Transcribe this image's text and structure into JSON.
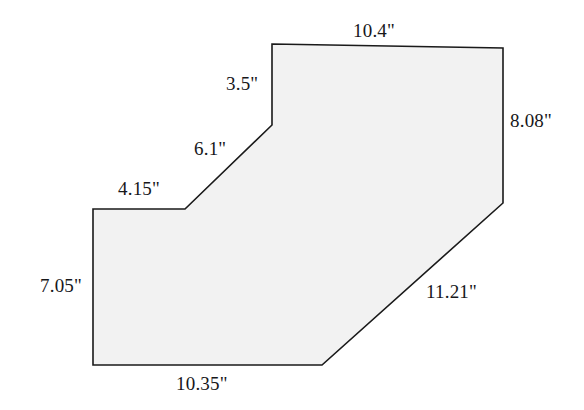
{
  "figure": {
    "kind": "dimensioned-polygon-diagram",
    "units": "inches",
    "fill_color": "#f2f2f2",
    "stroke_color": "#1a1a1a",
    "background_color": "#ffffff",
    "stroke_width": 1.6,
    "vertices": [
      [
        272,
        44
      ],
      [
        503,
        48
      ],
      [
        503,
        203
      ],
      [
        322,
        365
      ],
      [
        93,
        365
      ],
      [
        93,
        209
      ],
      [
        185,
        209
      ],
      [
        272,
        125
      ]
    ],
    "edges": [
      {
        "id": "top",
        "label": "10.4\"",
        "from": [
          272,
          44
        ],
        "to": [
          503,
          48
        ]
      },
      {
        "id": "right",
        "label": "8.08\"",
        "from": [
          503,
          48
        ],
        "to": [
          503,
          203
        ]
      },
      {
        "id": "low-diag",
        "label": "11.21\"",
        "from": [
          503,
          203
        ],
        "to": [
          322,
          365
        ]
      },
      {
        "id": "bottom",
        "label": "10.35\"",
        "from": [
          322,
          365
        ],
        "to": [
          93,
          365
        ]
      },
      {
        "id": "left",
        "label": "7.05\"",
        "from": [
          93,
          365
        ],
        "to": [
          93,
          209
        ]
      },
      {
        "id": "step-top",
        "label": "4.15\"",
        "from": [
          93,
          209
        ],
        "to": [
          185,
          209
        ]
      },
      {
        "id": "mid-diag",
        "label": "6.1\"",
        "from": [
          185,
          209
        ],
        "to": [
          272,
          125
        ]
      },
      {
        "id": "upper-left",
        "label": "3.5\"",
        "from": [
          272,
          125
        ],
        "to": [
          272,
          44
        ]
      }
    ],
    "labels": {
      "top": "10.4\"",
      "upper_left": "3.5\"",
      "right": "8.08\"",
      "mid_diagonal": "6.1\"",
      "step_top": "4.15\"",
      "left": "7.05\"",
      "lower_diagonal": "11.21\"",
      "bottom": "10.35\""
    }
  }
}
